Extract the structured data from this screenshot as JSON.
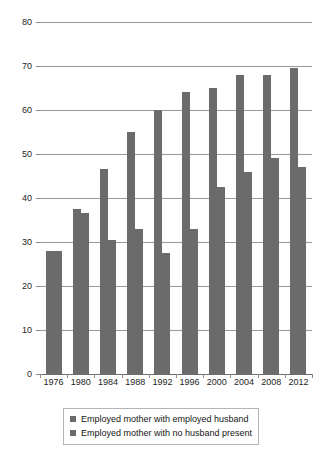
{
  "chart_data": {
    "type": "bar",
    "title": "",
    "subtitle": "",
    "xlabel": "",
    "ylabel": "",
    "ylim": [
      0,
      80
    ],
    "yticks": [
      0,
      10,
      20,
      30,
      40,
      50,
      60,
      70,
      80
    ],
    "grid": true,
    "legend_position": "bottom",
    "categories": [
      "1976",
      "1980",
      "1984",
      "1988",
      "1992",
      "1996",
      "2000",
      "2004",
      "2008",
      "2012"
    ],
    "series": [
      {
        "name": "Employed mother with employed husband",
        "color": "#6b6b6b",
        "values": [
          28.0,
          37.5,
          46.5,
          55.0,
          60.0,
          64.0,
          65.0,
          68.0,
          68.0,
          69.5
        ]
      },
      {
        "name": "Employed mother with no husband present",
        "color": "#6b6b6b",
        "values": [
          28.0,
          36.5,
          30.5,
          33.0,
          27.5,
          33.0,
          42.5,
          46.0,
          49.0,
          47.0
        ]
      }
    ]
  },
  "legend": {
    "items": [
      {
        "label": "Employed mother with employed husband",
        "swatch_name": "legend-swatch-series-a"
      },
      {
        "label": "Employed mother with no husband present",
        "swatch_name": "legend-swatch-series-b"
      }
    ]
  },
  "colors": {
    "bar": "#6b6b6b",
    "gridline": "#9a9a9a",
    "axis": "#6e6e6e",
    "background": "#fefefe",
    "text": "#1f1f1f"
  }
}
